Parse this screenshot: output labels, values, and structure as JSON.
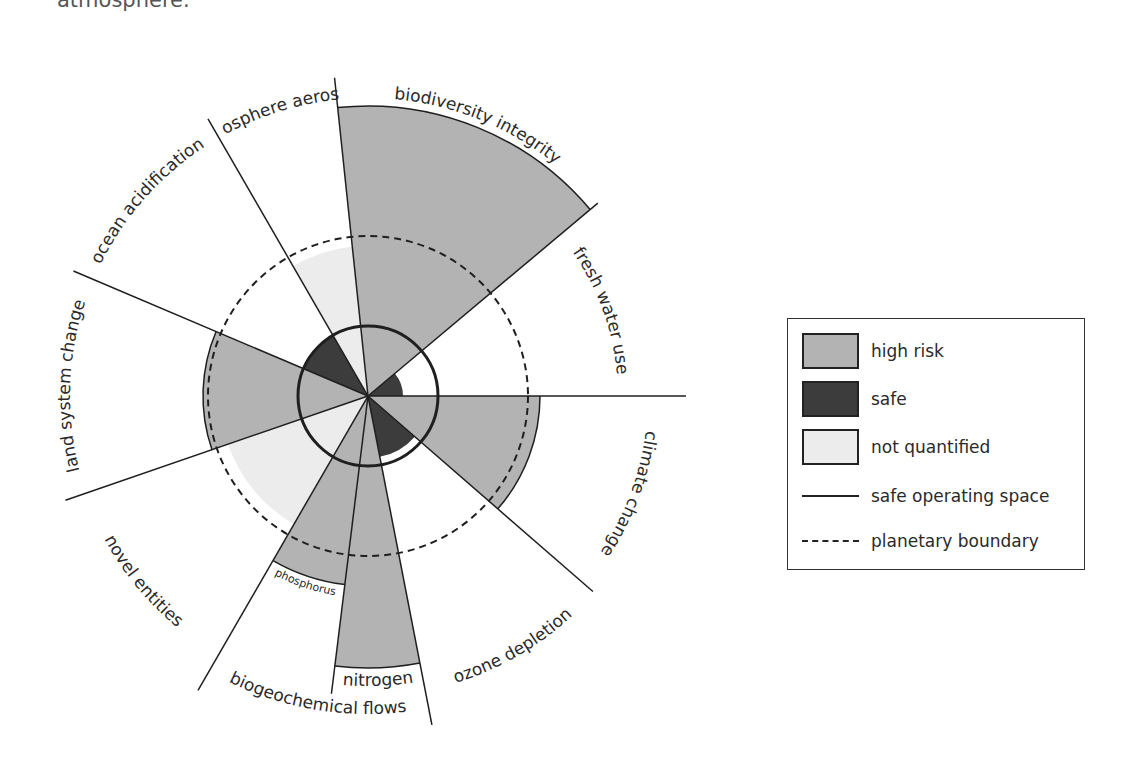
{
  "caption": {
    "text": "atmosphere."
  },
  "colors": {
    "high_risk": "#b3b3b3",
    "safe": "#3c3c3c",
    "not_quantified": "#ececec",
    "line": "#1f1f1f"
  },
  "diagram": {
    "labels": {
      "biodiversity_integrity": "biodiversity integrity",
      "fresh_water_use": "fresh water use",
      "climate_change": "climate change",
      "ozone_depletion": "ozone depletion",
      "biogeochemical_flows": "biogeochemical flows",
      "nitrogen": "nitrogen",
      "phosphorus": "phosphorus",
      "novel_entities": "novel entities",
      "land_system_change": "land system change",
      "ocean_acidification": "ocean acidification",
      "atmosphere_aerosols": "atmosphere aerosols"
    }
  },
  "legend": {
    "items": [
      {
        "label": "high risk",
        "type": "swatch",
        "color": "#b3b3b3"
      },
      {
        "label": "safe",
        "type": "swatch",
        "color": "#3c3c3c"
      },
      {
        "label": "not quantified",
        "type": "swatch",
        "color": "#ececec"
      },
      {
        "label": "safe operating space",
        "type": "solid-line"
      },
      {
        "label": "planetary boundary",
        "type": "dashed-line"
      }
    ]
  }
}
